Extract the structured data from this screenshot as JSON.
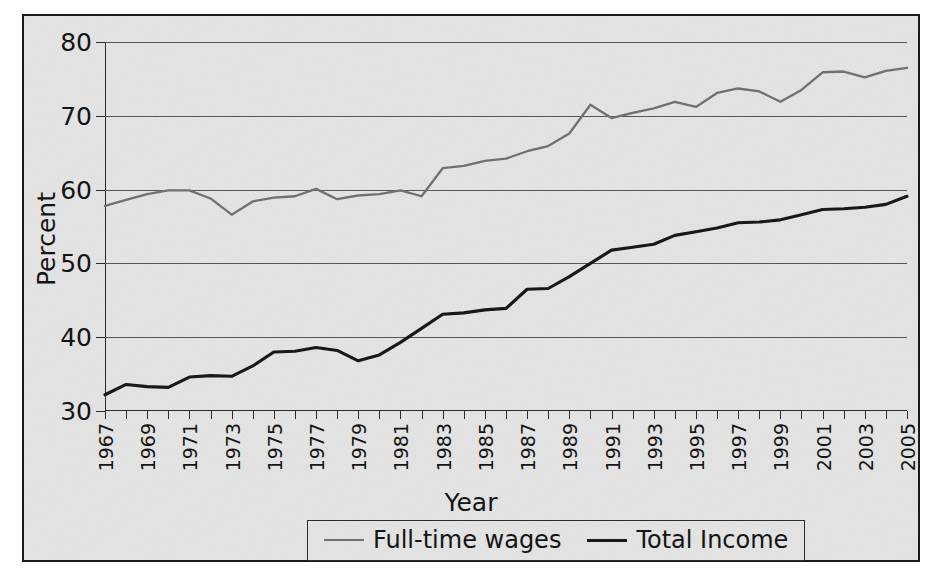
{
  "chart_data": {
    "type": "line",
    "title": "",
    "xlabel": "Year",
    "ylabel": "Percent",
    "ylim": [
      30,
      80
    ],
    "yticks": [
      30,
      40,
      50,
      60,
      70,
      80
    ],
    "grid": true,
    "legend_position": "bottom",
    "x": [
      1967,
      1968,
      1969,
      1970,
      1971,
      1972,
      1973,
      1974,
      1975,
      1976,
      1977,
      1978,
      1979,
      1980,
      1981,
      1982,
      1983,
      1984,
      1985,
      1986,
      1987,
      1988,
      1989,
      1990,
      1991,
      1992,
      1993,
      1994,
      1995,
      1996,
      1997,
      1998,
      1999,
      2000,
      2001,
      2002,
      2003,
      2004,
      2005
    ],
    "xtick_labels": [
      "1967",
      "1969",
      "1971",
      "1973",
      "1975",
      "1977",
      "1979",
      "1981",
      "1983",
      "1985",
      "1987",
      "1989",
      "1991",
      "1993",
      "1995",
      "1997",
      "1999",
      "2001",
      "2003",
      "2005"
    ],
    "series": [
      {
        "name": "Full-time wages",
        "color": "#6f6f6f",
        "values": [
          57.8,
          58.6,
          59.4,
          59.9,
          59.9,
          58.8,
          56.6,
          58.4,
          58.9,
          59.1,
          60.1,
          58.7,
          59.2,
          59.4,
          59.9,
          59.1,
          62.9,
          63.2,
          63.9,
          64.2,
          65.2,
          65.9,
          67.6,
          71.5,
          69.7,
          70.4,
          71.0,
          71.9,
          71.2,
          73.1,
          73.7,
          73.3,
          71.9,
          73.5,
          75.9,
          76.0,
          75.2,
          76.1,
          76.5
        ]
      },
      {
        "name": "Total Income",
        "color": "#151515",
        "values": [
          32.2,
          33.6,
          33.3,
          33.2,
          34.6,
          34.8,
          34.7,
          36.1,
          38.0,
          38.1,
          38.6,
          38.2,
          36.8,
          37.6,
          39.3,
          41.2,
          43.1,
          43.3,
          43.7,
          43.9,
          46.5,
          46.6,
          48.2,
          50.0,
          51.8,
          52.2,
          52.6,
          53.8,
          54.3,
          54.8,
          55.5,
          55.6,
          55.9,
          56.6,
          57.3,
          57.4,
          57.6,
          58.0,
          59.1
        ]
      }
    ]
  },
  "legend": {
    "entries": [
      {
        "label": "Full-time wages"
      },
      {
        "label": "Total Income"
      }
    ]
  },
  "axes": {
    "y_label": "Percent",
    "x_label": "Year"
  }
}
